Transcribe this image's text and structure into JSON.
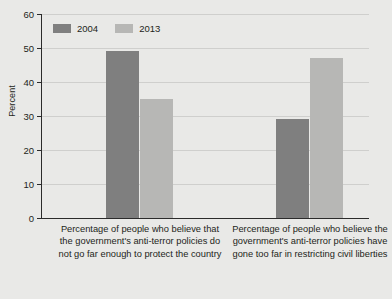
{
  "chart_data": {
    "type": "bar",
    "title": "",
    "subtitle": "",
    "xlabel": "",
    "ylabel": "Percent",
    "ylim": [
      0,
      60
    ],
    "yticks": [
      0,
      10,
      20,
      30,
      40,
      50,
      60
    ],
    "ytick_labels": [
      "0",
      "10",
      "20",
      "30",
      "40",
      "50",
      "60"
    ],
    "grid": true,
    "legend_position": "top-left",
    "categories": [
      "Percentage of people who believe that the government's anti-terror policies do not go far enough to protect the country",
      "Percentage of people who believe the government's anti-terror policies have gone too far in restricting civil liberties"
    ],
    "series": [
      {
        "name": "2004",
        "color": "#7f7f7f",
        "values": [
          49,
          29
        ]
      },
      {
        "name": "2013",
        "color": "#b7b7b5",
        "values": [
          35,
          47
        ]
      }
    ]
  },
  "legend": {
    "items": [
      {
        "label": "2004",
        "color": "#7f7f7f"
      },
      {
        "label": "2013",
        "color": "#b7b7b5"
      }
    ]
  },
  "axes": {
    "y_title": "Percent",
    "y_tick_labels": [
      "60",
      "50",
      "40",
      "30",
      "20",
      "10",
      "0"
    ]
  },
  "category_labels": [
    "Percentage of people who believe that the government's anti-terror policies do not go far enough to protect the country",
    "Percentage of people who believe the government's anti-terror policies have gone too far in restricting civil liberties"
  ],
  "colors": {
    "background": "#e9e9e7",
    "axis": "#2b2b2b",
    "gridline": "#cfcfcd",
    "series_2004": "#7f7f7f",
    "series_2013": "#b7b7b5",
    "text": "#231f20"
  }
}
